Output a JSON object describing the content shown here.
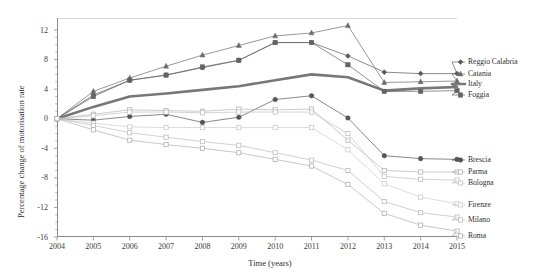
{
  "chart_data": {
    "type": "line",
    "title": "",
    "xlabel": "Time (years)",
    "ylabel": "Percentage change of motorisation rate",
    "x": [
      2004,
      2005,
      2006,
      2007,
      2008,
      2009,
      2010,
      2011,
      2012,
      2013,
      2014,
      2015
    ],
    "xtick_labels": [
      "2004",
      "2005",
      "2006",
      "2007",
      "2008",
      "2009",
      "2010",
      "2011",
      "2012",
      "2013",
      "2014",
      "2015"
    ],
    "ytick_labels": [
      "12",
      "8",
      "4",
      "0",
      "-4",
      "-8",
      "-12",
      "-16"
    ],
    "ytick_values": [
      12,
      8,
      4,
      0,
      -4,
      -8,
      -12,
      -16
    ],
    "ylim": [
      -17,
      13.5
    ],
    "xlim": [
      2004,
      2015
    ],
    "grid": false,
    "legend_position": "right",
    "series": [
      {
        "name": "Reggio Calabria",
        "marker": "diamond",
        "color": "#595959",
        "values": [
          0,
          3.2,
          5.2,
          5.9,
          6.9,
          7.9,
          10.3,
          10.3,
          8.5,
          6.3,
          6.1,
          6.1
        ]
      },
      {
        "name": "Catania",
        "marker": "triangle",
        "color": "#6b6b6b",
        "values": [
          0,
          3.7,
          5.5,
          7.1,
          8.6,
          9.9,
          11.2,
          11.6,
          12.6,
          4.9,
          5.0,
          5.1
        ]
      },
      {
        "name": "Italy",
        "marker": "none",
        "color": "#777777",
        "thick": true,
        "values": [
          0,
          1.6,
          3.0,
          3.4,
          3.9,
          4.4,
          5.2,
          6.0,
          5.6,
          3.8,
          4.1,
          4.3
        ]
      },
      {
        "name": "Foggia",
        "marker": "square",
        "color": "#636363",
        "values": [
          0,
          3.0,
          5.2,
          5.9,
          7.0,
          7.9,
          10.3,
          10.3,
          7.3,
          3.7,
          3.7,
          3.8
        ]
      },
      {
        "name": "Brescia",
        "marker": "circle",
        "color": "#555555",
        "values": [
          0,
          -0.2,
          0.3,
          0.6,
          -0.5,
          0.2,
          2.6,
          3.1,
          0.1,
          -5.0,
          -5.4,
          -5.5
        ]
      },
      {
        "name": "Parma",
        "marker": "open-square",
        "color": "#b4b4b4",
        "values": [
          0,
          0.6,
          1.2,
          1.1,
          1.0,
          1.3,
          1.2,
          1.3,
          -2.9,
          -7.0,
          -7.2,
          -7.2
        ]
      },
      {
        "name": "Bologna",
        "marker": "open-square",
        "color": "#c2c2c2",
        "values": [
          0,
          0.4,
          0.9,
          0.9,
          0.8,
          0.9,
          0.9,
          0.9,
          -2.0,
          -7.8,
          -8.2,
          -8.3
        ]
      },
      {
        "name": "Firenze",
        "marker": "open-square",
        "color": "#cbcbcb",
        "values": [
          0,
          -0.6,
          -1.1,
          -1.2,
          -1.2,
          -1.2,
          -1.2,
          -1.2,
          -4.2,
          -8.8,
          -10.6,
          -11.5
        ]
      },
      {
        "name": "Milano",
        "marker": "open-square",
        "color": "#bdbdbd",
        "values": [
          0,
          -0.9,
          -1.9,
          -2.5,
          -3.1,
          -3.6,
          -4.6,
          -5.6,
          -7.0,
          -11.2,
          -12.7,
          -13.3
        ]
      },
      {
        "name": "Roma",
        "marker": "open-square",
        "color": "#b0b0b0",
        "values": [
          0,
          -1.5,
          -2.9,
          -3.5,
          -4.0,
          -4.6,
          -5.5,
          -6.4,
          -8.9,
          -12.8,
          -14.4,
          -15.2
        ]
      }
    ]
  },
  "axis": {
    "x_title": "Time (years)",
    "y_title": "Percentage change of motorisation rate"
  },
  "legend": {
    "upper": [
      {
        "label": "Reggio Calabria",
        "marker": "diamond"
      },
      {
        "label": "Catania",
        "marker": "triangle"
      },
      {
        "label": "Italy",
        "marker": "thick-line"
      },
      {
        "label": "Foggia",
        "marker": "square"
      }
    ],
    "lower": [
      {
        "label": "Brescia",
        "marker": "circle"
      },
      {
        "label": "Parma",
        "marker": "open-square"
      },
      {
        "label": "Bologna",
        "marker": "open-square"
      },
      {
        "label": "Firenze",
        "marker": "open-square"
      },
      {
        "label": "Milano",
        "marker": "open-square"
      },
      {
        "label": "Roma",
        "marker": "open-square"
      }
    ]
  },
  "colors": {
    "axis": "#8a8a8a",
    "text": "#2e2e2e",
    "italy": "#777777"
  }
}
